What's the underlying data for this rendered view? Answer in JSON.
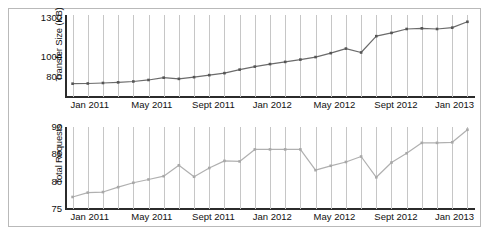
{
  "figure": {
    "background": "#ffffff",
    "border_color": "#b9b9b9"
  },
  "chart_data": [
    {
      "type": "line",
      "id": "transfer-size",
      "title": "",
      "xlabel": "",
      "ylabel": "Transfer Size (KB)",
      "ylim": [
        700,
        1300
      ],
      "yticks": [
        800,
        1000,
        1300
      ],
      "ytick_labels": [
        "800",
        "1000",
        "1300"
      ],
      "ytick_positions_frac": [
        0.758,
        0.513,
        0.035
      ],
      "grid": true,
      "grid_axis": "x",
      "legend": null,
      "line_color": "#6b6b6b",
      "marker_color": "#555555",
      "marker": "square",
      "x": [
        "Jan 2011",
        "Feb 2011",
        "Mar 2011",
        "Apr 2011",
        "May 2011",
        "Jun 2011",
        "Jul 2011",
        "Aug 2011",
        "Sept 2011",
        "Oct 2011",
        "Nov 2011",
        "Dec 2011",
        "Jan 2012",
        "Feb 2012",
        "Mar 2012",
        "Apr 2012",
        "May 2012",
        "Jun 2012",
        "Jul 2012",
        "Aug 2012",
        "Sept 2012",
        "Oct 2012",
        "Nov 2012",
        "Dec 2012",
        "Jan 2013",
        "Feb 2013",
        "Mar 2013"
      ],
      "xtick_labels": [
        "Jan 2011",
        "May 2011",
        "Sept 2011",
        "Jan 2012",
        "May 2012",
        "Sept 2012",
        "Jan 2013"
      ],
      "xtick_indices": [
        0,
        4,
        8,
        12,
        16,
        20,
        24
      ],
      "values": [
        735,
        737,
        742,
        748,
        757,
        772,
        795,
        783,
        800,
        820,
        840,
        875,
        905,
        930,
        952,
        975,
        1000,
        1030,
        1065,
        1035,
        1160,
        1185,
        1215,
        1220,
        1215,
        1225,
        1270
      ]
    },
    {
      "type": "line",
      "id": "total-requests",
      "title": "",
      "xlabel": "",
      "ylabel": "Total Requests",
      "ylim": [
        75,
        90
      ],
      "yticks": [
        75,
        80,
        85,
        90
      ],
      "ytick_labels": [
        "75",
        "80",
        "85",
        "90"
      ],
      "grid": true,
      "grid_axis": "x",
      "legend": null,
      "line_color": "#b0b0b0",
      "marker_color": "#a8a8a8",
      "marker": "square",
      "x": [
        "Jan 2011",
        "Feb 2011",
        "Mar 2011",
        "Apr 2011",
        "May 2011",
        "Jun 2011",
        "Jul 2011",
        "Aug 2011",
        "Sept 2011",
        "Oct 2011",
        "Nov 2011",
        "Dec 2011",
        "Jan 2012",
        "Feb 2012",
        "Mar 2012",
        "Apr 2012",
        "May 2012",
        "Jun 2012",
        "Jul 2012",
        "Aug 2012",
        "Sept 2012",
        "Oct 2012",
        "Nov 2012",
        "Dec 2012",
        "Jan 2013",
        "Feb 2013",
        "Mar 2013"
      ],
      "xtick_labels": [
        "Jan 2011",
        "May 2011",
        "Sept 2011",
        "Jan 2012",
        "May 2012",
        "Sept 2012",
        "Jan 2013"
      ],
      "xtick_indices": [
        0,
        4,
        8,
        12,
        16,
        20,
        24
      ],
      "values": [
        77.2,
        78.0,
        78.1,
        79.0,
        79.8,
        80.4,
        81.0,
        83.0,
        80.9,
        82.5,
        83.8,
        83.7,
        85.9,
        85.9,
        85.9,
        85.9,
        82.1,
        82.9,
        83.6,
        84.6,
        80.8,
        83.5,
        85.2,
        87.1,
        87.1,
        87.2,
        89.5
      ]
    }
  ]
}
